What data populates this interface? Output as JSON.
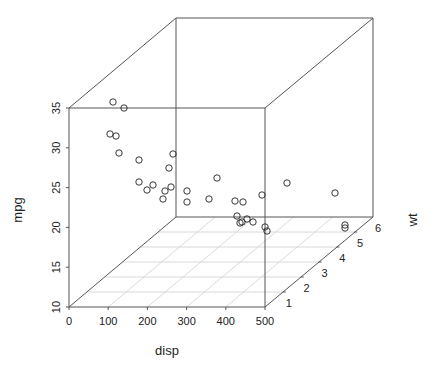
{
  "chart_data": {
    "type": "scatter",
    "subtype": "scatterplot3d",
    "title": "",
    "xlabel": "disp",
    "ylabel": "wt",
    "zlabel": "mpg",
    "xlim": [
      0,
      500
    ],
    "ylim": [
      0,
      6
    ],
    "zlim": [
      10,
      35
    ],
    "x_ticks": [
      "0",
      "100",
      "200",
      "300",
      "400",
      "500"
    ],
    "y_ticks": [
      "1",
      "2",
      "3",
      "4",
      "5",
      "6"
    ],
    "z_ticks": [
      "10",
      "15",
      "20",
      "25",
      "30",
      "35"
    ],
    "grid": "floor (x-y plane)",
    "box": true,
    "marker": "open circle",
    "point_color": "#222222",
    "points": [
      {
        "disp": 160.0,
        "wt": 2.62,
        "mpg": 21.0
      },
      {
        "disp": 160.0,
        "wt": 2.875,
        "mpg": 21.0
      },
      {
        "disp": 108.0,
        "wt": 2.32,
        "mpg": 22.8
      },
      {
        "disp": 258.0,
        "wt": 3.215,
        "mpg": 21.4
      },
      {
        "disp": 360.0,
        "wt": 3.44,
        "mpg": 18.7
      },
      {
        "disp": 225.0,
        "wt": 3.46,
        "mpg": 18.1
      },
      {
        "disp": 360.0,
        "wt": 3.57,
        "mpg": 14.3
      },
      {
        "disp": 146.7,
        "wt": 3.19,
        "mpg": 24.4
      },
      {
        "disp": 140.8,
        "wt": 3.15,
        "mpg": 22.8
      },
      {
        "disp": 167.6,
        "wt": 3.44,
        "mpg": 19.2
      },
      {
        "disp": 167.6,
        "wt": 3.44,
        "mpg": 17.8
      },
      {
        "disp": 275.8,
        "wt": 4.07,
        "mpg": 16.4
      },
      {
        "disp": 275.8,
        "wt": 3.73,
        "mpg": 17.3
      },
      {
        "disp": 275.8,
        "wt": 3.78,
        "mpg": 15.2
      },
      {
        "disp": 472.0,
        "wt": 5.25,
        "mpg": 10.4
      },
      {
        "disp": 460.0,
        "wt": 5.424,
        "mpg": 10.4
      },
      {
        "disp": 440.0,
        "wt": 5.345,
        "mpg": 14.7
      },
      {
        "disp": 78.7,
        "wt": 2.2,
        "mpg": 32.4
      },
      {
        "disp": 75.7,
        "wt": 1.615,
        "mpg": 30.4
      },
      {
        "disp": 71.1,
        "wt": 1.835,
        "mpg": 33.9
      },
      {
        "disp": 120.1,
        "wt": 2.465,
        "mpg": 21.5
      },
      {
        "disp": 318.0,
        "wt": 3.52,
        "mpg": 15.5
      },
      {
        "disp": 304.0,
        "wt": 3.435,
        "mpg": 15.2
      },
      {
        "disp": 350.0,
        "wt": 3.84,
        "mpg": 13.3
      },
      {
        "disp": 400.0,
        "wt": 3.845,
        "mpg": 19.2
      },
      {
        "disp": 79.0,
        "wt": 1.935,
        "mpg": 27.3
      },
      {
        "disp": 120.3,
        "wt": 2.14,
        "mpg": 26.0
      },
      {
        "disp": 95.1,
        "wt": 1.513,
        "mpg": 30.4
      },
      {
        "disp": 351.0,
        "wt": 3.17,
        "mpg": 15.8
      },
      {
        "disp": 145.0,
        "wt": 2.77,
        "mpg": 19.7
      },
      {
        "disp": 301.0,
        "wt": 3.57,
        "mpg": 15.0
      },
      {
        "disp": 121.0,
        "wt": 2.78,
        "mpg": 21.4
      }
    ],
    "screen_points": [
      [
        113,
        102
      ],
      [
        124,
        108
      ],
      [
        110,
        134
      ],
      [
        116,
        136
      ],
      [
        119,
        153
      ],
      [
        139,
        160
      ],
      [
        173,
        154
      ],
      [
        169,
        168
      ],
      [
        139,
        182
      ],
      [
        147,
        190
      ],
      [
        153,
        185
      ],
      [
        165,
        191
      ],
      [
        171,
        187
      ],
      [
        163,
        199
      ],
      [
        187,
        191
      ],
      [
        187,
        202
      ],
      [
        217,
        178
      ],
      [
        209,
        199
      ],
      [
        235,
        201
      ],
      [
        243,
        202
      ],
      [
        262,
        195
      ],
      [
        287,
        183
      ],
      [
        335,
        193
      ],
      [
        237,
        216
      ],
      [
        247,
        219
      ],
      [
        240,
        223
      ],
      [
        242,
        222
      ],
      [
        253,
        222
      ],
      [
        265,
        227
      ],
      [
        267,
        231
      ],
      [
        345,
        225
      ],
      [
        345,
        228
      ]
    ]
  },
  "axes": {
    "x_label": "disp",
    "y_label": "wt",
    "z_label": "mpg",
    "x_ticks": [
      "0",
      "100",
      "200",
      "300",
      "400",
      "500"
    ],
    "y_ticks": [
      "1",
      "2",
      "3",
      "4",
      "5",
      "6"
    ],
    "z_ticks": [
      "10",
      "15",
      "20",
      "25",
      "30",
      "35"
    ]
  },
  "colors": {
    "box": "#555555",
    "grid": "#d0d0d0",
    "points": "#222222",
    "text": "#222222"
  }
}
